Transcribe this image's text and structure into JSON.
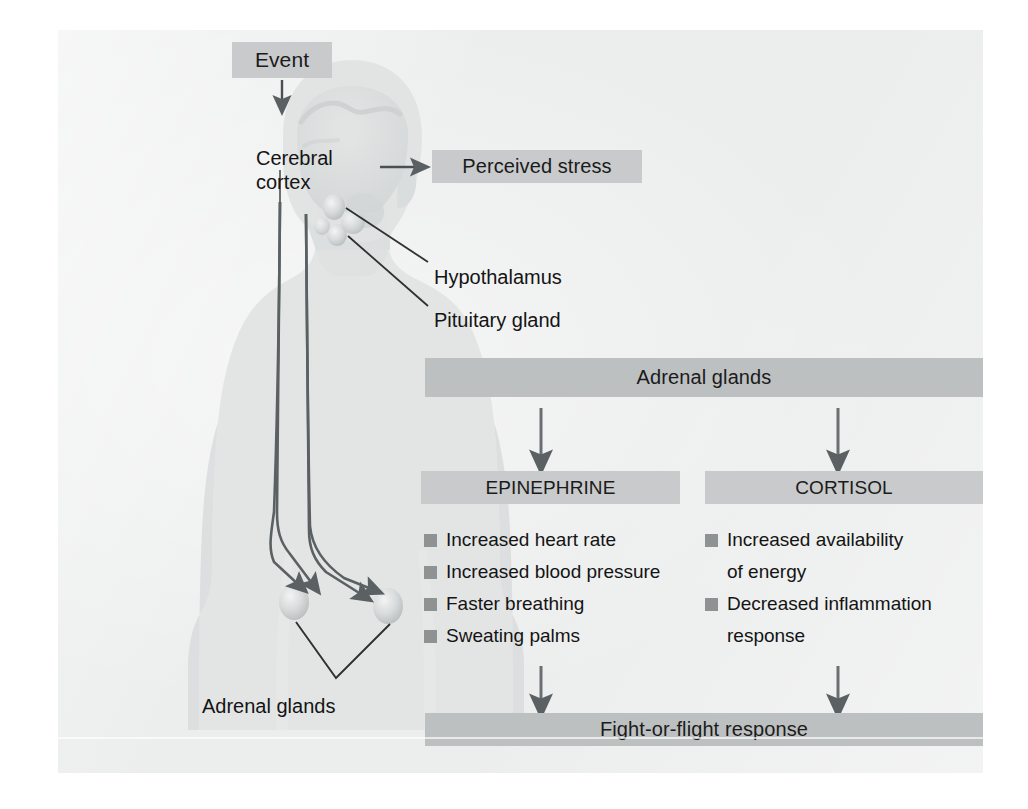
{
  "diagram": {
    "boxes": {
      "event": "Event",
      "perceived_stress": "Perceived stress",
      "adrenal_glands_bar": "Adrenal glands",
      "epinephrine": "EPINEPHRINE",
      "cortisol": "CORTISOL",
      "fight_or_flight": "Fight-or-flight response"
    },
    "labels": {
      "cerebral_cortex": "Cerebral cortex",
      "hypothalamus": "Hypothalamus",
      "pituitary_gland": "Pituitary gland",
      "adrenal_glands_body": "Adrenal glands"
    },
    "epinephrine_effects": [
      "Increased heart rate",
      "Increased blood pressure",
      "Faster breathing",
      "Sweating palms"
    ],
    "cortisol_effects": [
      "Increased availability",
      "of energy",
      "Decreased inflammation",
      "response"
    ],
    "cortisol_effects_bulleted": [
      true,
      false,
      true,
      false
    ],
    "colors": {
      "plate_background": "#eceded",
      "box_mid": "#c8cacb",
      "box_light": "#d2d4d4",
      "box_dark": "#bdc0c1",
      "bullet_square": "#8f9293",
      "ink": "#3a3f42",
      "text": "#141414",
      "body_silhouette": "#e2e4e4",
      "gland_highlight": "#cfd2d2"
    }
  }
}
